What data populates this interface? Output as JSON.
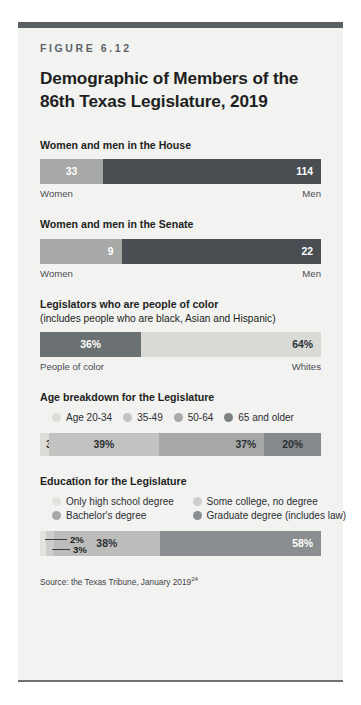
{
  "figure": {
    "label": "FIGURE 6.12",
    "title": "Demographic of Members of the 86th Texas Legislature, 2019",
    "source_text": "Source: the Texas Tribune, January 2019",
    "source_note": "24"
  },
  "palette": {
    "light": "#d9d9d6",
    "light_mid": "#c2c3c0",
    "mid": "#a7a9a6",
    "mid_dark": "#8e9290",
    "dark": "#6b7073",
    "darkest": "#4a4e52",
    "rule": "#5a5f63",
    "card_bg": "#f2f2f0"
  },
  "sections": [
    {
      "title": "Women and men in the House",
      "subtitle": "",
      "chart_data": {
        "type": "bar",
        "title": "Women and men in the House",
        "orientation": "horizontal-stacked",
        "categories": [
          "Women",
          "Men"
        ],
        "values": [
          33,
          114
        ],
        "value_labels": [
          "33",
          "114"
        ],
        "total": 147,
        "unit": "members",
        "colors": [
          "#a7a9a6",
          "#4a4e52"
        ],
        "label_colors": [
          "#ffffff",
          "#ffffff"
        ],
        "axis_labels": [
          "Women",
          "Men"
        ]
      }
    },
    {
      "title": "Women and men in the Senate",
      "subtitle": "",
      "chart_data": {
        "type": "bar",
        "title": "Women and men in the Senate",
        "orientation": "horizontal-stacked",
        "categories": [
          "Women",
          "Men"
        ],
        "values": [
          9,
          22
        ],
        "value_labels": [
          "9",
          "22"
        ],
        "total": 31,
        "unit": "members",
        "colors": [
          "#a7a9a6",
          "#4a4e52"
        ],
        "label_colors": [
          "#ffffff",
          "#ffffff"
        ],
        "axis_labels": [
          "Women",
          "Men"
        ]
      }
    },
    {
      "title": "Legislators who are people of color",
      "subtitle": "(includes people who are black, Asian and Hispanic)",
      "chart_data": {
        "type": "bar",
        "title": "Legislators who are people of color",
        "orientation": "horizontal-stacked",
        "categories": [
          "People of color",
          "Whites"
        ],
        "values": [
          36,
          64
        ],
        "value_labels": [
          "36%",
          "64%"
        ],
        "total": 100,
        "unit": "percent",
        "colors": [
          "#6b7073",
          "#d9d9d6"
        ],
        "label_colors": [
          "#ffffff",
          "#2b2f33"
        ],
        "axis_labels": [
          "People of color",
          "Whites"
        ]
      }
    },
    {
      "title": "Age breakdown for the Legislature",
      "subtitle": "",
      "chart_data": {
        "type": "bar",
        "title": "Age breakdown for the Legislature",
        "orientation": "horizontal-stacked",
        "categories": [
          "Age 20-34",
          "35-49",
          "50-64",
          "65 and older"
        ],
        "values": [
          3,
          39,
          37,
          20
        ],
        "value_labels": [
          "3%",
          "39%",
          "37%",
          "20%"
        ],
        "total": 100,
        "unit": "percent",
        "colors": [
          "#dcdcd9",
          "#c2c3c0",
          "#a7a9a6",
          "#85898b"
        ],
        "label_colors": [
          "#2b2f33",
          "#2b2f33",
          "#2b2f33",
          "#2b2f33"
        ],
        "legend": [
          "Age 20-34",
          "35-49",
          "50-64",
          "65 and older"
        ],
        "legend_colors": [
          "#dcdcd9",
          "#c2c3c0",
          "#a7a9a6",
          "#7d8184"
        ],
        "legend_position": "above"
      }
    },
    {
      "title": "Education for the Legislature",
      "subtitle": "",
      "chart_data": {
        "type": "bar",
        "title": "Education for the Legislature",
        "orientation": "horizontal-stacked",
        "categories": [
          "Only high school degree",
          "Some college, no degree",
          "Bachelor's degree",
          "Graduate degree (includes law)"
        ],
        "values": [
          2,
          3,
          38,
          58
        ],
        "value_labels": [
          "2%",
          "3%",
          "38%",
          "58%"
        ],
        "total": 101,
        "unit": "percent",
        "colors": [
          "#e2e2df",
          "#cdcecb",
          "#bcbdba",
          "#8a8e90"
        ],
        "label_colors": [
          "#1d1f21",
          "#1d1f21",
          "#2b2f33",
          "#ffffff"
        ],
        "legend": [
          "Only high school degree",
          "Some college, no degree",
          "Bachelor's degree",
          "Graduate degree (includes law)"
        ],
        "legend_colors": [
          "#e2e2df",
          "#cdcecb",
          "#a7a9a6",
          "#8a8e90"
        ],
        "legend_position": "above",
        "callouts": [
          {
            "value_label": "2%",
            "series": "Only high school degree"
          },
          {
            "value_label": "3%",
            "series": "Some college, no degree"
          }
        ]
      }
    }
  ]
}
